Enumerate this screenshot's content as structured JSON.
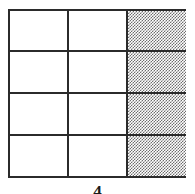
{
  "figure": {
    "type": "fraction-area-model-grid",
    "columns": 3,
    "rows": 4,
    "total_cells": 12,
    "shaded_cells": 4,
    "shaded_column_index": 3,
    "fraction_shaded": "4/12",
    "caption_top_fragment": "▬▬",
    "caption_bottom_fragment": "4",
    "colors": {
      "border": "#2b2b2b",
      "cell_fill": "#ffffff",
      "shaded_fill": "#6d6d6d",
      "background": "#ffffff"
    },
    "cells": [
      {
        "row": 1,
        "col": 1,
        "state": "unshaded"
      },
      {
        "row": 1,
        "col": 2,
        "state": "unshaded"
      },
      {
        "row": 1,
        "col": 3,
        "state": "shaded"
      },
      {
        "row": 2,
        "col": 1,
        "state": "unshaded"
      },
      {
        "row": 2,
        "col": 2,
        "state": "unshaded"
      },
      {
        "row": 2,
        "col": 3,
        "state": "shaded"
      },
      {
        "row": 3,
        "col": 1,
        "state": "unshaded"
      },
      {
        "row": 3,
        "col": 2,
        "state": "unshaded"
      },
      {
        "row": 3,
        "col": 3,
        "state": "shaded"
      },
      {
        "row": 4,
        "col": 1,
        "state": "unshaded"
      },
      {
        "row": 4,
        "col": 2,
        "state": "unshaded"
      },
      {
        "row": 4,
        "col": 3,
        "state": "shaded"
      }
    ]
  }
}
